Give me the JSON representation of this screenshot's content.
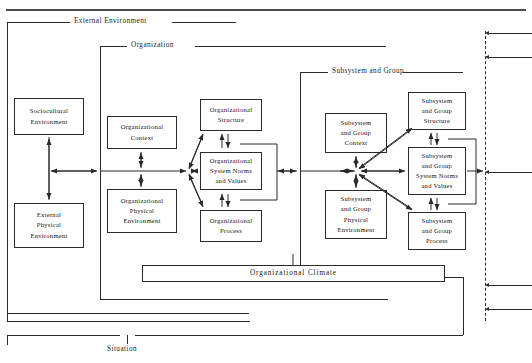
{
  "figure": {
    "type": "nested-systems-diagram",
    "title_rule": "horizontal-rule",
    "frames": [
      {
        "id": "external",
        "label": "External Environment"
      },
      {
        "id": "organization",
        "label": "Organization"
      },
      {
        "id": "subsystem",
        "label": "Subsystem and Group"
      },
      {
        "id": "situation",
        "label": "Situation"
      }
    ]
  },
  "nodes": {
    "sociocultural_environment": "Sociocultural\nEnvironment",
    "external_physical_environment": "External\nPhysical\nEnvironment",
    "organizational_context": "Organizational\nContext",
    "organizational_physical_environment": "Organizational\nPhysical\nEnvironment",
    "organizational_structure": "Organizational\nStructure",
    "organizational_system_norms": "Organizational\nSystem Norms\nand Values",
    "organizational_process": "Organizational\nProcess",
    "subsystem_group_context": "Subsystem\nand Group\nContext",
    "subsystem_group_physical_environment": "Subsystem\nand Group\nPhysical\nEnvironment",
    "subsystem_group_structure": "Subsystem\nand Group\nStructure",
    "subsystem_group_system_norms": "Subsystem\nand Group\nSystem Norms\nand Values",
    "subsystem_group_process": "Subsystem\nand Group\nProcess",
    "organizational_climate": "Organizational  Climate"
  },
  "colors": {
    "line": "#2a2a2a",
    "text": "#141414",
    "background": "#ffffff"
  },
  "connectors": {
    "dashed_boundary": "dashed-vertical-right-boundary",
    "inbound_arrow_count": 4
  }
}
